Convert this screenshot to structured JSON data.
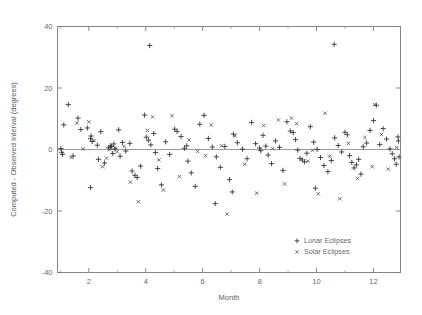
{
  "chart_data": {
    "type": "scatter",
    "title": "",
    "xlabel": "Month",
    "ylabel": "Computed - Observed Interval (degrees)",
    "xlim": [
      0.9,
      12.95
    ],
    "ylim": [
      -40,
      40
    ],
    "grid": false,
    "legend_position": "bottom-right",
    "xticks": [
      2,
      4,
      6,
      8,
      10,
      12
    ],
    "xtick_labels": [
      "2",
      "4",
      "6",
      "8",
      "10",
      "12"
    ],
    "xminorticks": [
      1,
      3,
      5,
      7,
      9,
      11
    ],
    "yticks": [
      -40,
      -20,
      0,
      20,
      40
    ],
    "ytick_labels": [
      "-40",
      "-20",
      "0",
      "20",
      "40"
    ],
    "reference_line_y": 0,
    "series": [
      {
        "name": "Lunar Eclipses",
        "marker": "plus",
        "points": [
          [
            1.02,
            0.3
          ],
          [
            1.05,
            -0.9
          ],
          [
            1.12,
            8.0
          ],
          [
            1.28,
            14.6
          ],
          [
            1.45,
            -2.1
          ],
          [
            1.62,
            10.2
          ],
          [
            1.72,
            6.5
          ],
          [
            1.95,
            7.0
          ],
          [
            2.06,
            3.5
          ],
          [
            2.08,
            4.4
          ],
          [
            2.12,
            2.6
          ],
          [
            2.3,
            1.4
          ],
          [
            2.42,
            5.8
          ],
          [
            2.55,
            -4.4
          ],
          [
            2.7,
            0.6
          ],
          [
            2.76,
            1.2
          ],
          [
            2.8,
            0.9
          ],
          [
            2.84,
            -1.3
          ],
          [
            2.88,
            1.8
          ],
          [
            2.92,
            0.2
          ],
          [
            3.05,
            6.4
          ],
          [
            3.18,
            2.3
          ],
          [
            3.3,
            -0.5
          ],
          [
            3.44,
            2.0
          ],
          [
            3.52,
            -7.0
          ],
          [
            3.62,
            -8.4
          ],
          [
            3.7,
            -9.1
          ],
          [
            3.82,
            -5.4
          ],
          [
            3.96,
            11.2
          ],
          [
            4.02,
            4.0
          ],
          [
            4.1,
            3.0
          ],
          [
            4.18,
            1.5
          ],
          [
            4.28,
            5.2
          ],
          [
            4.34,
            -1.0
          ],
          [
            4.42,
            -6.2
          ],
          [
            4.55,
            -11.5
          ],
          [
            4.7,
            2.5
          ],
          [
            4.84,
            -1.6
          ],
          [
            5.02,
            6.6
          ],
          [
            5.1,
            5.9
          ],
          [
            5.24,
            4.2
          ],
          [
            5.36,
            0.4
          ],
          [
            5.48,
            -3.8
          ],
          [
            5.6,
            -7.6
          ],
          [
            5.74,
            -12.0
          ],
          [
            5.9,
            8.2
          ],
          [
            6.05,
            11.1
          ],
          [
            6.2,
            3.6
          ],
          [
            6.34,
            0.8
          ],
          [
            6.48,
            -2.4
          ],
          [
            6.62,
            -5.8
          ],
          [
            6.78,
            1.0
          ],
          [
            6.94,
            -9.8
          ],
          [
            7.08,
            5.0
          ],
          [
            7.22,
            2.2
          ],
          [
            7.4,
            0.1
          ],
          [
            7.56,
            -3.0
          ],
          [
            7.72,
            8.8
          ],
          [
            7.86,
            1.9
          ],
          [
            8.0,
            0.5
          ],
          [
            8.04,
            -0.4
          ],
          [
            8.12,
            4.6
          ],
          [
            8.22,
            1.1
          ],
          [
            8.3,
            -1.8
          ],
          [
            8.42,
            -4.6
          ],
          [
            8.56,
            2.8
          ],
          [
            8.7,
            0.7
          ],
          [
            8.82,
            -6.8
          ],
          [
            8.96,
            9.0
          ],
          [
            9.08,
            6.0
          ],
          [
            9.18,
            5.5
          ],
          [
            9.26,
            3.2
          ],
          [
            9.34,
            -0.2
          ],
          [
            9.42,
            -2.9
          ],
          [
            9.5,
            -3.4
          ],
          [
            9.58,
            -4.0
          ],
          [
            9.66,
            -1.2
          ],
          [
            9.78,
            7.4
          ],
          [
            9.9,
            2.4
          ],
          [
            10.02,
            0.0
          ],
          [
            10.14,
            -2.6
          ],
          [
            10.26,
            -5.2
          ],
          [
            10.4,
            -7.2
          ],
          [
            10.52,
            -3.6
          ],
          [
            10.64,
            3.8
          ],
          [
            10.76,
            1.3
          ],
          [
            10.88,
            -0.8
          ],
          [
            11.0,
            5.6
          ],
          [
            11.08,
            4.8
          ],
          [
            11.16,
            -2.0
          ],
          [
            11.24,
            -4.2
          ],
          [
            11.32,
            -6.0
          ],
          [
            11.4,
            -5.0
          ],
          [
            11.48,
            -3.2
          ],
          [
            11.56,
            -8.0
          ],
          [
            11.64,
            0.9
          ],
          [
            11.76,
            2.1
          ],
          [
            11.88,
            6.2
          ],
          [
            12.0,
            9.4
          ],
          [
            12.1,
            14.4
          ],
          [
            12.22,
            1.6
          ],
          [
            12.34,
            6.8
          ],
          [
            12.46,
            3.4
          ],
          [
            12.58,
            0.2
          ],
          [
            12.66,
            -1.4
          ],
          [
            12.74,
            -3.0
          ],
          [
            12.8,
            -4.8
          ],
          [
            12.86,
            4.1
          ],
          [
            4.14,
            33.8
          ],
          [
            10.62,
            34.2
          ],
          [
            2.34,
            -3.2
          ],
          [
            3.1,
            -2.2
          ],
          [
            7.04,
            -13.8
          ],
          [
            9.96,
            -12.6
          ],
          [
            6.44,
            -17.6
          ],
          [
            2.06,
            -12.4
          ],
          [
            12.88,
            2.8
          ],
          [
            12.9,
            -2.4
          ],
          [
            1.08,
            -1.6
          ],
          [
            5.44,
            1.2
          ]
        ]
      },
      {
        "name": "Solar Eclipses",
        "marker": "cross",
        "points": [
          [
            1.38,
            -2.6
          ],
          [
            1.58,
            8.6
          ],
          [
            2.0,
            9.0
          ],
          [
            2.18,
            2.9
          ],
          [
            2.48,
            -5.6
          ],
          [
            2.62,
            -2.8
          ],
          [
            2.94,
            0.4
          ],
          [
            3.0,
            -0.7
          ],
          [
            3.24,
            1.0
          ],
          [
            3.46,
            -10.6
          ],
          [
            3.74,
            -17.0
          ],
          [
            4.06,
            6.2
          ],
          [
            4.24,
            10.6
          ],
          [
            4.46,
            -3.4
          ],
          [
            4.92,
            11.0
          ],
          [
            5.18,
            -8.8
          ],
          [
            5.52,
            3.1
          ],
          [
            6.1,
            -2.0
          ],
          [
            6.3,
            8.0
          ],
          [
            6.86,
            -21.0
          ],
          [
            7.14,
            4.4
          ],
          [
            7.48,
            -4.8
          ],
          [
            7.9,
            -14.2
          ],
          [
            8.14,
            7.8
          ],
          [
            8.46,
            0.3
          ],
          [
            8.88,
            -11.2
          ],
          [
            9.12,
            10.2
          ],
          [
            9.3,
            8.4
          ],
          [
            9.7,
            -3.8
          ],
          [
            10.06,
            -14.4
          ],
          [
            10.3,
            11.8
          ],
          [
            10.46,
            -2.2
          ],
          [
            10.82,
            -16.0
          ],
          [
            11.12,
            2.0
          ],
          [
            11.44,
            -9.4
          ],
          [
            11.7,
            3.9
          ],
          [
            12.04,
            14.6
          ],
          [
            12.28,
            4.9
          ],
          [
            12.52,
            -6.4
          ],
          [
            12.82,
            0.6
          ],
          [
            1.8,
            0.2
          ],
          [
            2.72,
            0.0
          ],
          [
            5.82,
            -0.6
          ],
          [
            8.66,
            9.6
          ],
          [
            9.86,
            -0.3
          ],
          [
            11.96,
            -5.6
          ],
          [
            6.66,
            1.2
          ],
          [
            4.62,
            -13.2
          ]
        ]
      }
    ]
  },
  "legend": {
    "entries": [
      {
        "label": "Lunar Eclipses",
        "marker": "plus"
      },
      {
        "label": "Solar Eclipses",
        "marker": "cross"
      }
    ]
  },
  "colors": {
    "axis": "#7a7a7a",
    "text": "#6a6a6a",
    "zero_line": "#9c9c9c",
    "marker_lunar": "#2e2e2e",
    "marker_solar": "#4f4f4f",
    "background": "#ffffff"
  }
}
